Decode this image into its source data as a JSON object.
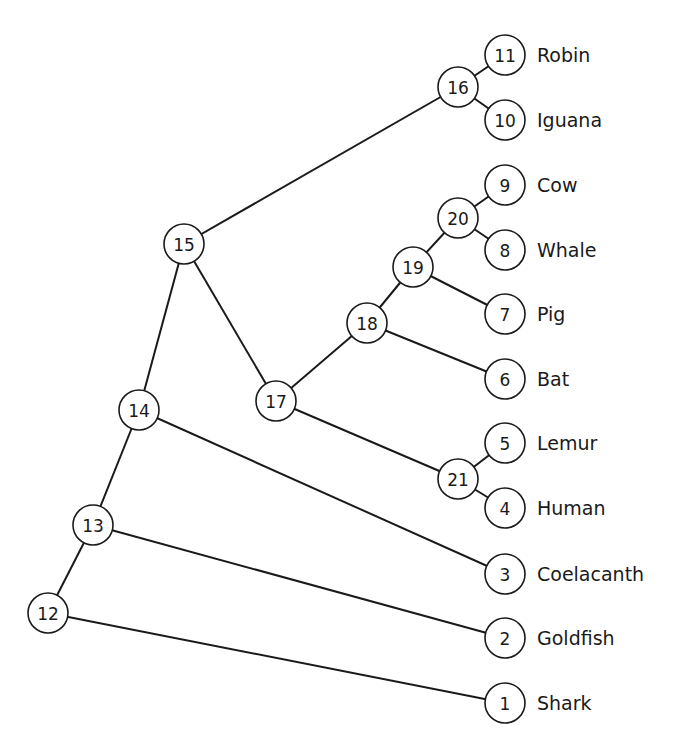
{
  "diagram": {
    "type": "phylogenetic-tree",
    "node_radius": 20,
    "colors": {
      "line": "#1a1a1a",
      "fill": "#ffffff",
      "text": "#1a1a1a"
    },
    "nodes": [
      {
        "id": "1",
        "x": 505,
        "y": 703,
        "label": "Shark"
      },
      {
        "id": "2",
        "x": 505,
        "y": 638,
        "label": "Goldfish"
      },
      {
        "id": "3",
        "x": 505,
        "y": 574,
        "label": "Coelacanth"
      },
      {
        "id": "4",
        "x": 505,
        "y": 508,
        "label": "Human"
      },
      {
        "id": "5",
        "x": 505,
        "y": 443,
        "label": "Lemur"
      },
      {
        "id": "6",
        "x": 505,
        "y": 379,
        "label": "Bat"
      },
      {
        "id": "7",
        "x": 505,
        "y": 314,
        "label": "Pig"
      },
      {
        "id": "8",
        "x": 505,
        "y": 250,
        "label": "Whale"
      },
      {
        "id": "9",
        "x": 505,
        "y": 185,
        "label": "Cow"
      },
      {
        "id": "10",
        "x": 505,
        "y": 120,
        "label": "Iguana"
      },
      {
        "id": "11",
        "x": 505,
        "y": 55,
        "label": "Robin"
      },
      {
        "id": "12",
        "x": 48,
        "y": 613,
        "label": ""
      },
      {
        "id": "13",
        "x": 93,
        "y": 525,
        "label": ""
      },
      {
        "id": "14",
        "x": 139,
        "y": 410,
        "label": ""
      },
      {
        "id": "15",
        "x": 184,
        "y": 244,
        "label": ""
      },
      {
        "id": "16",
        "x": 458,
        "y": 87,
        "label": ""
      },
      {
        "id": "17",
        "x": 276,
        "y": 401,
        "label": ""
      },
      {
        "id": "18",
        "x": 367,
        "y": 323,
        "label": ""
      },
      {
        "id": "19",
        "x": 413,
        "y": 267,
        "label": ""
      },
      {
        "id": "20",
        "x": 458,
        "y": 218,
        "label": ""
      },
      {
        "id": "21",
        "x": 458,
        "y": 479,
        "label": ""
      }
    ],
    "edges": [
      [
        "12",
        "13"
      ],
      [
        "12",
        "1"
      ],
      [
        "13",
        "14"
      ],
      [
        "13",
        "2"
      ],
      [
        "14",
        "15"
      ],
      [
        "14",
        "3"
      ],
      [
        "15",
        "16"
      ],
      [
        "15",
        "17"
      ],
      [
        "16",
        "11"
      ],
      [
        "16",
        "10"
      ],
      [
        "17",
        "18"
      ],
      [
        "17",
        "21"
      ],
      [
        "18",
        "19"
      ],
      [
        "18",
        "6"
      ],
      [
        "19",
        "20"
      ],
      [
        "19",
        "7"
      ],
      [
        "20",
        "9"
      ],
      [
        "20",
        "8"
      ],
      [
        "21",
        "5"
      ],
      [
        "21",
        "4"
      ]
    ]
  }
}
